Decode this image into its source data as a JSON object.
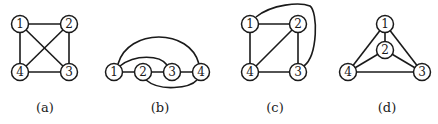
{
  "figure": {
    "panels": [
      {
        "caption": "(a)",
        "nodes": [
          {
            "id": "1",
            "x": 20,
            "y": 24
          },
          {
            "id": "2",
            "x": 69,
            "y": 24
          },
          {
            "id": "3",
            "x": 69,
            "y": 72
          },
          {
            "id": "4",
            "x": 20,
            "y": 72
          }
        ],
        "edges": [
          [
            "1",
            "2"
          ],
          [
            "2",
            "3"
          ],
          [
            "3",
            "4"
          ],
          [
            "4",
            "1"
          ],
          [
            "1",
            "3"
          ],
          [
            "2",
            "4"
          ]
        ]
      },
      {
        "caption": "(b)",
        "nodes": [
          {
            "id": "1",
            "x": 114,
            "y": 72
          },
          {
            "id": "2",
            "x": 143,
            "y": 72
          },
          {
            "id": "3",
            "x": 172,
            "y": 72
          },
          {
            "id": "4",
            "x": 201,
            "y": 72
          }
        ],
        "edges": [
          [
            "1",
            "2"
          ],
          [
            "2",
            "3"
          ],
          [
            "3",
            "4"
          ],
          [
            "1",
            "4"
          ],
          [
            "1",
            "3"
          ],
          [
            "2",
            "4"
          ]
        ]
      },
      {
        "caption": "(c)",
        "nodes": [
          {
            "id": "1",
            "x": 250,
            "y": 24
          },
          {
            "id": "2",
            "x": 298,
            "y": 24
          },
          {
            "id": "3",
            "x": 298,
            "y": 72
          },
          {
            "id": "4",
            "x": 250,
            "y": 72
          }
        ],
        "edges": [
          [
            "1",
            "2"
          ],
          [
            "2",
            "3"
          ],
          [
            "3",
            "4"
          ],
          [
            "4",
            "1"
          ],
          [
            "2",
            "4"
          ],
          [
            "1",
            "3"
          ]
        ]
      },
      {
        "caption": "(d)",
        "nodes": [
          {
            "id": "1",
            "x": 385,
            "y": 24
          },
          {
            "id": "2",
            "x": 385,
            "y": 50
          },
          {
            "id": "3",
            "x": 422,
            "y": 72
          },
          {
            "id": "4",
            "x": 348,
            "y": 72
          }
        ],
        "edges": [
          [
            "1",
            "2"
          ],
          [
            "1",
            "3"
          ],
          [
            "1",
            "4"
          ],
          [
            "2",
            "3"
          ],
          [
            "2",
            "4"
          ],
          [
            "3",
            "4"
          ]
        ]
      }
    ],
    "colors": {
      "stroke": "#1a1a1a",
      "background": "#ffffff"
    }
  }
}
